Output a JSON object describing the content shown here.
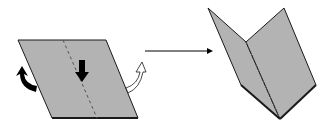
{
  "diagram": {
    "colors": {
      "paper_fill": "#b3b3b3",
      "outline": "#1a1a1a",
      "crease": "#555555",
      "arrow": "#000000",
      "background": "#ffffff"
    },
    "steps": [
      {
        "name": "flat-sheet",
        "crease": "dashed",
        "indicators": [
          "down-arrow",
          "curved-arrow-left-black",
          "curved-arrow-right-white"
        ]
      },
      {
        "name": "transition",
        "indicator": "right-arrow"
      },
      {
        "name": "folded-sheet",
        "crease": "dashed",
        "shape": "v-fold"
      }
    ]
  }
}
